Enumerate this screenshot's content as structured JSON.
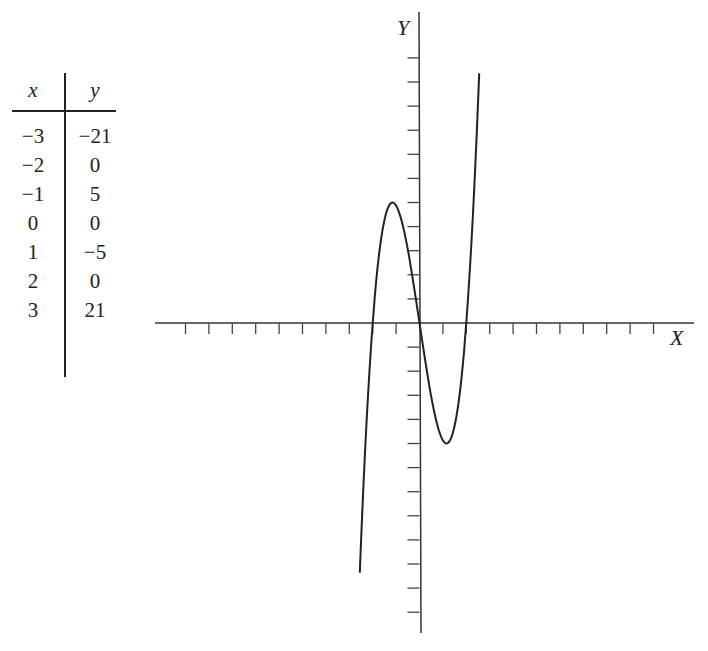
{
  "table": {
    "headers": [
      "x",
      "y"
    ],
    "rows": [
      [
        "−3",
        "−21"
      ],
      [
        "−2",
        "0"
      ],
      [
        "−1",
        "5"
      ],
      [
        "0",
        "0"
      ],
      [
        "1",
        "−5"
      ],
      [
        "2",
        "0"
      ],
      [
        "3",
        "21"
      ]
    ]
  },
  "graph": {
    "x_label": "X",
    "y_label": "Y"
  },
  "chart_data": {
    "type": "line",
    "title": "",
    "xlabel": "X",
    "ylabel": "Y",
    "table": {
      "x": [
        -3,
        -2,
        -1,
        0,
        1,
        2,
        3
      ],
      "y": [
        -21,
        0,
        5,
        0,
        -5,
        0,
        21
      ]
    },
    "curve": {
      "description": "cubic with zeros at x=-2, 0, 2; local max about (-1.15, 5), local min about (1.15, -5)",
      "x_range": [
        -2.55,
        2.55
      ],
      "y_range": [
        -12,
        12
      ]
    },
    "x_ticks": [
      -10,
      -9,
      -8,
      -7,
      -6,
      -5,
      -4,
      -3,
      -2,
      -1,
      1,
      2,
      3,
      4,
      5,
      6,
      7,
      8,
      9,
      10
    ],
    "y_ticks": [
      -12,
      -11,
      -10,
      -9,
      -8,
      -7,
      -6,
      -5,
      -4,
      -3,
      -2,
      -1,
      1,
      2,
      3,
      4,
      5,
      6,
      7,
      8,
      9,
      10,
      11
    ],
    "tick_labels_shown": false,
    "grid": false,
    "xlim": [
      -11.3,
      11.6
    ],
    "ylim": [
      -12.9,
      12.9
    ]
  }
}
